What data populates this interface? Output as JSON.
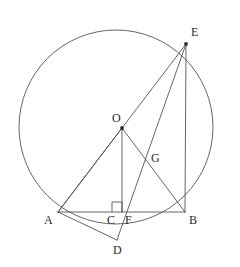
{
  "figure": {
    "width": 240,
    "height": 267,
    "background_color": "#ffffff",
    "line_color": "#4a4a4a",
    "circle_color": "#555555",
    "label_color": "#2b2b2b"
  },
  "circle": {
    "name": "main-circle",
    "center_x": 116,
    "center_y": 127,
    "radius": 97
  },
  "points": [
    {
      "id": "O",
      "label": "O",
      "x": 122,
      "y": 128,
      "label_x": 112,
      "label_y": 112,
      "dot": true
    },
    {
      "id": "A",
      "label": "A",
      "x": 58,
      "y": 212,
      "label_x": 44,
      "label_y": 214,
      "dot": false
    },
    {
      "id": "B",
      "label": "B",
      "x": 185,
      "y": 212,
      "label_x": 189,
      "label_y": 214,
      "dot": false
    },
    {
      "id": "C",
      "label": "C",
      "x": 117,
      "y": 212,
      "label_x": 107,
      "label_y": 214,
      "dot": false
    },
    {
      "id": "D",
      "label": "D",
      "x": 117,
      "y": 240,
      "label_x": 113,
      "label_y": 244,
      "dot": false
    },
    {
      "id": "E",
      "label": "E",
      "x": 186,
      "y": 44,
      "label_x": 191,
      "label_y": 26,
      "dot": true
    },
    {
      "id": "F",
      "label": "F",
      "x": 127,
      "y": 212,
      "label_x": 125,
      "label_y": 214,
      "dot": false
    },
    {
      "id": "G",
      "label": "G",
      "x": 147,
      "y": 160,
      "label_x": 151,
      "label_y": 152,
      "dot": false
    }
  ],
  "segments": [
    {
      "name": "segment-AB",
      "from": "A",
      "to": "B",
      "x1": 58,
      "y1": 212,
      "x2": 185,
      "y2": 212
    },
    {
      "name": "segment-AE",
      "from": "A",
      "to": "E",
      "x1": 58,
      "y1": 212,
      "x2": 186,
      "y2": 44
    },
    {
      "name": "segment-AO",
      "from": "A",
      "to": "O",
      "x1": 58,
      "y1": 212,
      "x2": 122,
      "y2": 128
    },
    {
      "name": "segment-AD",
      "from": "A",
      "to": "D",
      "x1": 58,
      "y1": 212,
      "x2": 117,
      "y2": 240
    },
    {
      "name": "segment-OC",
      "from": "O",
      "to": "C",
      "x1": 122,
      "y1": 128,
      "x2": 122,
      "y2": 212
    },
    {
      "name": "segment-OB",
      "from": "O",
      "to": "B",
      "x1": 122,
      "y1": 128,
      "x2": 185,
      "y2": 212
    },
    {
      "name": "segment-ED",
      "from": "E",
      "to": "D",
      "x1": 186,
      "y1": 44,
      "x2": 117,
      "y2": 240
    },
    {
      "name": "segment-EB",
      "from": "E",
      "to": "B",
      "x1": 186,
      "y1": 44,
      "x2": 185,
      "y2": 212
    }
  ],
  "right_angle": {
    "name": "right-angle-at-C",
    "at_point": "C",
    "x": 112,
    "y": 202,
    "size": 10
  }
}
